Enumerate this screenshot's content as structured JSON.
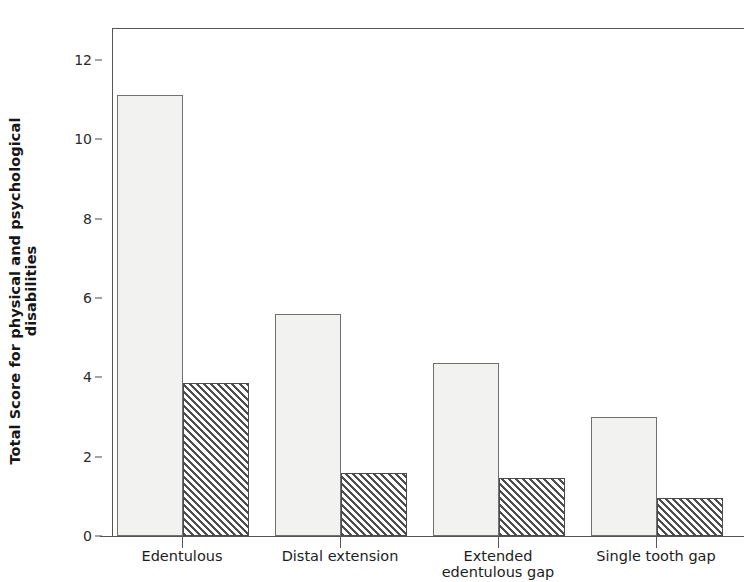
{
  "chart_data": {
    "type": "bar",
    "title": "",
    "subtitle": "",
    "xlabel": "",
    "ylabel": "Total Score for physical and psychological disabilities",
    "ylabel_line1": "Total Score for physical and psychological",
    "ylabel_line2": "disabilities",
    "categories": [
      "Edentulous",
      "Distal extension",
      "Extended edentulous gap",
      "Single tooth gap"
    ],
    "category_lines": [
      [
        "Edentulous"
      ],
      [
        "Distal extension"
      ],
      [
        "Extended",
        "edentulous gap"
      ],
      [
        "Single tooth gap"
      ]
    ],
    "series": [
      {
        "name": "Open bar",
        "fill": "open",
        "values": [
          11.1,
          5.6,
          4.35,
          3.0
        ]
      },
      {
        "name": "Hatched bar",
        "fill": "hatched",
        "values": [
          3.85,
          1.6,
          1.45,
          0.95
        ]
      }
    ],
    "ylim": [
      0,
      12.8
    ],
    "yticks": [
      0,
      2,
      4,
      6,
      8,
      10,
      12
    ],
    "ytick_labels": [
      "0",
      "2",
      "4",
      "6",
      "8",
      "10",
      "12"
    ],
    "grid": false,
    "legend": false,
    "legend_position": "none",
    "axis_color": "#545454",
    "open_fill_color": "#f2f2f0",
    "hatch_color": "#4e4e4e",
    "background_color": "#ffffff"
  }
}
